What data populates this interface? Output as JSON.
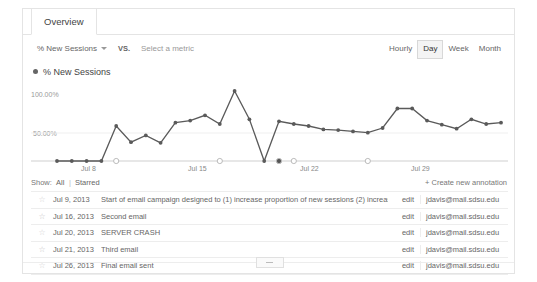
{
  "tab": {
    "label": "Overview"
  },
  "metric_row": {
    "primary_metric": "% New Sessions",
    "vs_label": "VS.",
    "secondary_metric_placeholder": "Select a metric",
    "caret_icon": "chevron-down-icon"
  },
  "granularity": {
    "options": [
      "Hourly",
      "Day",
      "Week",
      "Month"
    ],
    "selected": "Day"
  },
  "legend": {
    "marker_icon": "series-dot-icon",
    "label": "% New Sessions"
  },
  "show_row": {
    "label": "Show:",
    "all": "All",
    "separator": "|",
    "starred": "Starred",
    "create_link": "+ Create new annotation"
  },
  "table": {
    "rows": [
      {
        "star_icon": "star-outline-icon",
        "starred": false,
        "date": "Jul 9, 2013",
        "text": "Start of email campaign designed to (1) increase proportion of new sessions (2) increase engagement",
        "edit": "edit",
        "email": "jdavis@mail.sdsu.edu"
      },
      {
        "star_icon": "star-outline-icon",
        "starred": true,
        "date": "Jul 16, 2013",
        "text": "Second email",
        "edit": "edit",
        "email": "jdavis@mail.sdsu.edu"
      },
      {
        "star_icon": "star-outline-icon",
        "starred": false,
        "date": "Jul 20, 2013",
        "text": "SERVER CRASH",
        "edit": "edit",
        "email": "jdavis@mail.sdsu.edu"
      },
      {
        "star_icon": "star-outline-icon",
        "starred": true,
        "date": "Jul 21, 2013",
        "text": "Third email",
        "edit": "edit",
        "email": "jdavis@mail.sdsu.edu"
      },
      {
        "star_icon": "star-outline-icon",
        "starred": false,
        "date": "Jul 26, 2013",
        "text": "Final email sent",
        "edit": "edit",
        "email": "jdavis@mail.sdsu.edu"
      }
    ]
  },
  "bottom_handle": {
    "icon": "collapse-handle-icon"
  },
  "colors": {
    "series": "#5a5a5a",
    "axis": "#cccccc",
    "border": "#e4e4e4",
    "text": "#666666"
  },
  "chart_data": {
    "type": "line",
    "title": "% New Sessions",
    "xlabel": "",
    "ylabel": "% New Sessions",
    "ylim": [
      0,
      110
    ],
    "ytick_labels": [
      "50.00%",
      "100.00%"
    ],
    "yticks": [
      50,
      100
    ],
    "xtick_labels": [
      "Jul 8",
      "Jul 15",
      "Jul 22",
      "Jul 29"
    ],
    "grid": false,
    "legend_position": "top-left",
    "series": [
      {
        "name": "% New Sessions",
        "x": [
          "Jul 5",
          "Jul 6",
          "Jul 7",
          "Jul 8",
          "Jul 9",
          "Jul 10",
          "Jul 11",
          "Jul 12",
          "Jul 13",
          "Jul 14",
          "Jul 15",
          "Jul 16",
          "Jul 17",
          "Jul 18",
          "Jul 19",
          "Jul 20",
          "Jul 21",
          "Jul 22",
          "Jul 23",
          "Jul 24",
          "Jul 25",
          "Jul 26",
          "Jul 27",
          "Jul 28",
          "Jul 29",
          "Jul 30",
          "Jul 31",
          "Aug 1",
          "Aug 2",
          "Aug 3",
          "Aug 4"
        ],
        "values": [
          0,
          0,
          0,
          0,
          52,
          28,
          38,
          27,
          57,
          60,
          68,
          55,
          104,
          62,
          0,
          59,
          55,
          52,
          47,
          46,
          44,
          42,
          49,
          78,
          78,
          60,
          54,
          48,
          62,
          55,
          57
        ]
      }
    ],
    "annotations": [
      {
        "date": "Jul 9, 2013",
        "state": "outline"
      },
      {
        "date": "Jul 16, 2013",
        "state": "outline"
      },
      {
        "date": "Jul 20, 2013",
        "state": "filled"
      },
      {
        "date": "Jul 21, 2013",
        "state": "outline"
      },
      {
        "date": "Jul 26, 2013",
        "state": "outline"
      }
    ]
  }
}
